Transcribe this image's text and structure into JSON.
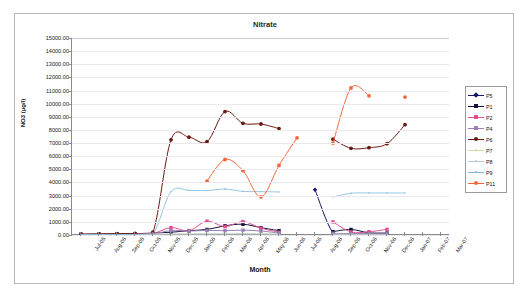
{
  "window": {
    "ghost_top_text": " "
  },
  "chart_data": {
    "type": "line",
    "title": "Nitrate",
    "xlabel": "Month",
    "ylabel": "NO3 (µg/l)",
    "ylim": [
      0,
      15000
    ],
    "ytick_step": 1000,
    "grid": true,
    "legend_position": "right",
    "ytick_labels": [
      "15000.00",
      "14000.00",
      "13000.00",
      "12000.00",
      "11000.00",
      "10000.00",
      "9000.00",
      "8000.00",
      "7000.00",
      "6000.00",
      "5000.00",
      "4000.00",
      "3000.00",
      "2000.00",
      "1000.00",
      "0.00"
    ],
    "categories": [
      "Jul-05",
      "Aug-05",
      "Sep-05",
      "Oct-05",
      "Nov-05",
      "Dec-05",
      "Jan-06",
      "Feb-06",
      "Mar-06",
      "Apr-06",
      "May-06",
      "Jun-06",
      "Jul-06",
      "Aug-06",
      "Sep-06",
      "Oct-06",
      "Nov-06",
      "Dec-06",
      "Jan-07",
      "Feb-07",
      "Mar-07"
    ],
    "series": [
      {
        "name": "P5",
        "color": "#16166e",
        "marker": "diamond",
        "values": [
          null,
          null,
          null,
          null,
          null,
          null,
          null,
          null,
          null,
          null,
          null,
          null,
          null,
          3450,
          160,
          90,
          120,
          60,
          null,
          null,
          null
        ]
      },
      {
        "name": "P1",
        "color": "#12123c",
        "marker": "square",
        "values": [
          60,
          70,
          80,
          90,
          150,
          210,
          330,
          420,
          700,
          820,
          560,
          330,
          null,
          null,
          260,
          420,
          170,
          150,
          null,
          null,
          null
        ]
      },
      {
        "name": "P2",
        "color": "#e0508f",
        "marker": "square",
        "values": [
          40,
          50,
          60,
          70,
          120,
          560,
          330,
          1050,
          640,
          1020,
          520,
          210,
          null,
          null,
          1000,
          230,
          250,
          430,
          null,
          null,
          null
        ]
      },
      {
        "name": "P4",
        "color": "#9a7fb8",
        "marker": "square",
        "values": [
          30,
          35,
          45,
          55,
          95,
          330,
          300,
          350,
          330,
          370,
          300,
          150,
          null,
          null,
          130,
          110,
          120,
          130,
          null,
          null,
          null
        ]
      },
      {
        "name": "P6",
        "color": "#6b1a12",
        "marker": "circle",
        "values": [
          60,
          80,
          100,
          120,
          220,
          7250,
          7450,
          7100,
          9400,
          8500,
          8450,
          8100,
          null,
          null,
          7300,
          6600,
          6650,
          6950,
          8400,
          null,
          null
        ]
      },
      {
        "name": "P7",
        "color": "#c9dfa0",
        "marker": "dot",
        "values": [
          20,
          25,
          30,
          40,
          60,
          80,
          90,
          95,
          100,
          105,
          95,
          70,
          null,
          null,
          60,
          55,
          50,
          45,
          null,
          null,
          null
        ]
      },
      {
        "name": "P8",
        "color": "#b9c5d8",
        "marker": "dot",
        "values": [
          15,
          18,
          22,
          28,
          45,
          60,
          65,
          70,
          72,
          75,
          68,
          52,
          null,
          null,
          40,
          38,
          36,
          34,
          null,
          null,
          null
        ]
      },
      {
        "name": "P9",
        "color": "#7fb8dd",
        "marker": "dot",
        "values": [
          25,
          30,
          35,
          45,
          80,
          3300,
          3400,
          3380,
          3500,
          3320,
          3300,
          3280,
          null,
          null,
          2900,
          3180,
          3200,
          3200,
          3200,
          null,
          null
        ]
      },
      {
        "name": "P11",
        "color": "#f4663a",
        "marker": "circle",
        "values": [
          null,
          null,
          null,
          null,
          null,
          null,
          null,
          4100,
          5750,
          4900,
          2900,
          5300,
          7400,
          null,
          7000,
          11200,
          10600,
          null,
          10500,
          null,
          null
        ]
      }
    ]
  },
  "legend": {
    "items": [
      {
        "label": "P5"
      },
      {
        "label": "P1"
      },
      {
        "label": "P2"
      },
      {
        "label": "P4"
      },
      {
        "label": "P6"
      },
      {
        "label": "P7"
      },
      {
        "label": "P8"
      },
      {
        "label": "P9"
      },
      {
        "label": "P11"
      }
    ]
  }
}
